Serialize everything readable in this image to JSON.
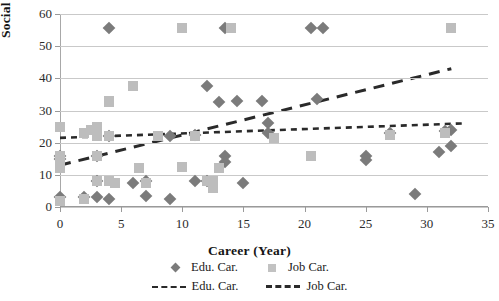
{
  "chart_data": {
    "type": "scatter",
    "title": "",
    "xlabel": "Career (Year)",
    "ylabel": "Social Networks",
    "xlim": [
      0,
      35
    ],
    "ylim": [
      0,
      60
    ],
    "xticks": [
      0,
      5,
      10,
      15,
      20,
      25,
      30,
      35
    ],
    "yticks": [
      0,
      10,
      20,
      30,
      40,
      50,
      60
    ],
    "grid": "horizontal",
    "legend_position": "bottom",
    "colors": {
      "edu_marker": "#7b7b7b",
      "job_marker": "#bdbdbd",
      "trend_line": "#2a2a2a",
      "gridline": "#c9c9c9"
    },
    "series": [
      {
        "name": "Edu. Car.",
        "marker": "diamond",
        "color": "#7b7b7b",
        "points": [
          [
            0,
            3
          ],
          [
            0,
            15
          ],
          [
            0,
            16
          ],
          [
            2,
            3
          ],
          [
            3,
            3
          ],
          [
            3,
            8
          ],
          [
            3,
            16
          ],
          [
            4,
            55.5
          ],
          [
            4,
            2.5
          ],
          [
            4,
            22
          ],
          [
            6,
            7.5
          ],
          [
            7,
            3.5
          ],
          [
            7,
            8
          ],
          [
            9,
            2.5
          ],
          [
            9,
            22
          ],
          [
            11,
            8
          ],
          [
            11,
            22.5
          ],
          [
            12,
            8
          ],
          [
            12,
            37.5
          ],
          [
            13,
            32.5
          ],
          [
            13.5,
            55.5
          ],
          [
            13.5,
            16
          ],
          [
            13.5,
            14
          ],
          [
            14.5,
            33
          ],
          [
            15,
            7.5
          ],
          [
            16.5,
            33
          ],
          [
            17,
            26
          ],
          [
            17,
            23
          ],
          [
            20.5,
            55.5
          ],
          [
            21.5,
            55.5
          ],
          [
            21,
            33.5
          ],
          [
            25,
            16
          ],
          [
            25,
            14.5
          ],
          [
            27,
            23
          ],
          [
            29,
            4
          ],
          [
            31,
            17
          ],
          [
            31.5,
            23.5
          ],
          [
            32,
            19
          ],
          [
            32,
            24
          ]
        ]
      },
      {
        "name": "Job Car.",
        "marker": "square",
        "color": "#bdbdbd",
        "points": [
          [
            0,
            25
          ],
          [
            0,
            16
          ],
          [
            0,
            14
          ],
          [
            0,
            12
          ],
          [
            0,
            2
          ],
          [
            2,
            23
          ],
          [
            2,
            2.5
          ],
          [
            2.5,
            24
          ],
          [
            3,
            25
          ],
          [
            3,
            22
          ],
          [
            3,
            16
          ],
          [
            3,
            8
          ],
          [
            4,
            22
          ],
          [
            4,
            8
          ],
          [
            4.5,
            7.5
          ],
          [
            4,
            32.5
          ],
          [
            4,
            33
          ],
          [
            6,
            37.5
          ],
          [
            6.5,
            12
          ],
          [
            7,
            7.5
          ],
          [
            8,
            22
          ],
          [
            10,
            55.5
          ],
          [
            10,
            12.5
          ],
          [
            11,
            22
          ],
          [
            12,
            8
          ],
          [
            12.5,
            8
          ],
          [
            12.5,
            6
          ],
          [
            13,
            12
          ],
          [
            14,
            55.5
          ],
          [
            17.5,
            21.5
          ],
          [
            20.5,
            16
          ],
          [
            27,
            22.5
          ],
          [
            32,
            55.5
          ],
          [
            31.5,
            23
          ]
        ]
      }
    ],
    "trendlines": [
      {
        "name": "Edu. Car.",
        "style": "dotted-dash",
        "x_start": 0,
        "y_start": 21.5,
        "x_end": 33,
        "y_end": 26
      },
      {
        "name": "Job Car.",
        "style": "dashed",
        "x_start": 0,
        "y_start": 13,
        "x_end": 32,
        "y_end": 43
      }
    ]
  },
  "legend": {
    "markers": [
      {
        "label": "Edu. Car.",
        "key": "diamond-marker-icon"
      },
      {
        "label": "Job Car.",
        "key": "square-marker-icon"
      }
    ],
    "lines": [
      {
        "label": "Edu. Car.",
        "key": "dotted-line-icon"
      },
      {
        "label": "Job Car.",
        "key": "dashed-line-icon"
      }
    ]
  }
}
